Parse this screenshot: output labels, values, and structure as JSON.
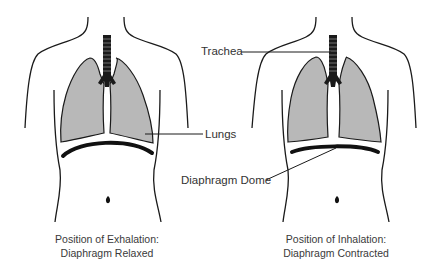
{
  "colors": {
    "outline": "#1a1a1a",
    "lung_fill": "#b8b8b8",
    "diaphragm": "#111111",
    "label_text": "#333333",
    "background": "#ffffff"
  },
  "labels": {
    "trachea": "Trachea",
    "lungs": "Lungs",
    "diaphragm_dome": "Diaphragm Dome"
  },
  "figures": [
    {
      "id": "exhalation",
      "caption_line1": "Position of Exhalation:",
      "caption_line2": "Diaphragm Relaxed",
      "diaphragm_state": "relaxed (domed upward)"
    },
    {
      "id": "inhalation",
      "caption_line1": "Position of Inhalation:",
      "caption_line2": "Diaphragm Contracted",
      "diaphragm_state": "contracted (flattened)"
    }
  ]
}
